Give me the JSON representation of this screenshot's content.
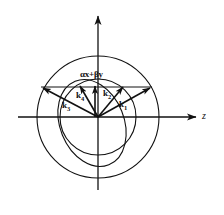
{
  "figure": {
    "type": "vector-diagram",
    "axes": {
      "horizontal": {
        "label": "z",
        "arrow": "right",
        "name": "z-axis"
      },
      "vertical": {
        "label": "",
        "arrow": "up",
        "name": "x-axis"
      }
    },
    "origin": {
      "x": 98,
      "y": 117
    },
    "curves": [
      {
        "name": "outer-circle",
        "shape": "circle",
        "cx": 98,
        "cy": 117,
        "r": 61
      },
      {
        "name": "inner-circle",
        "shape": "circle",
        "cx": 98,
        "cy": 117,
        "r": 38
      },
      {
        "name": "index-ellipse",
        "shape": "ellipse",
        "cx": 92,
        "cy": 123,
        "rx": 32,
        "ry": 45,
        "rotation": -22
      }
    ],
    "vectors": [
      {
        "name": "k1",
        "label": "k",
        "subscript": "1",
        "tip": {
          "x": 152,
          "y": 87
        },
        "label_pos": {
          "x": 120,
          "y": 104
        }
      },
      {
        "name": "k2",
        "label": "k",
        "subscript": "2",
        "tip": {
          "x": 124,
          "y": 85
        },
        "label_pos": {
          "x": 104,
          "y": 93
        }
      },
      {
        "name": "k3",
        "label": "k",
        "subscript": "3",
        "tip": {
          "x": 41,
          "y": 86
        },
        "label_pos": {
          "x": 65,
          "y": 105
        }
      },
      {
        "name": "k4",
        "label": "k",
        "subscript": "4",
        "tip": {
          "x": 79,
          "y": 85
        },
        "label_pos": {
          "x": 78,
          "y": 95
        }
      }
    ],
    "polarization": {
      "name": "polarization-vector",
      "label": "αx+βy",
      "tip": {
        "x": 98,
        "y": 85
      },
      "label_pos": {
        "x": 85,
        "y": 75
      }
    },
    "tie_line": {
      "name": "phase-matching-line",
      "x1": 41,
      "y1": 87,
      "x2": 152,
      "y2": 87
    },
    "colors": {
      "stroke": "#111111",
      "background": "#ffffff"
    }
  }
}
